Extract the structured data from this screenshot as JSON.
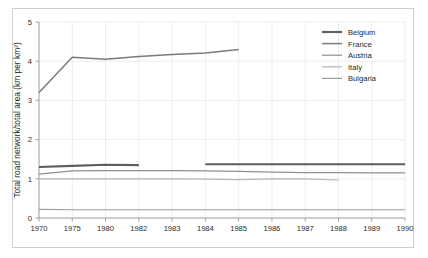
{
  "chart_data": {
    "type": "line",
    "title": "",
    "xlabel": "",
    "ylabel": "Total road network/total area (km per km²)",
    "categories": [
      "1970",
      "1975",
      "1980",
      "1982",
      "1983",
      "1984",
      "1985",
      "1986",
      "1987",
      "1988",
      "1989",
      "1990"
    ],
    "ylim": [
      0,
      5
    ],
    "yticks": [
      "0",
      "1",
      "2",
      "3",
      "4",
      "5"
    ],
    "grid": true,
    "legend_position": "top-right",
    "series": [
      {
        "name": "Belgium",
        "color": "#5e5e5e",
        "width": 2.1,
        "values": [
          1.3,
          1.33,
          1.36,
          1.35,
          null,
          1.37,
          1.37,
          1.37,
          1.37,
          1.37,
          1.37,
          1.37
        ]
      },
      {
        "name": "France",
        "color": "#7a7a7a",
        "width": 1.5,
        "values": [
          3.2,
          4.1,
          4.05,
          4.12,
          4.17,
          4.21,
          4.3,
          null,
          null,
          null,
          null,
          null
        ]
      },
      {
        "name": "Austria",
        "color": "#8f8f8f",
        "width": 1.2,
        "values": [
          1.12,
          1.2,
          1.21,
          1.21,
          1.21,
          1.2,
          1.19,
          1.17,
          1.16,
          1.16,
          1.15,
          1.15
        ]
      },
      {
        "name": "Italy",
        "color": "#b4b4b4",
        "width": 1.2,
        "values": [
          1.0,
          1.0,
          1.0,
          1.0,
          1.0,
          0.99,
          0.98,
          1.0,
          1.0,
          0.97,
          null,
          null
        ]
      },
      {
        "name": "Bulgaria",
        "color": "#9c9c9c",
        "width": 1.2,
        "values": [
          0.22,
          0.21,
          0.21,
          0.21,
          0.21,
          0.21,
          0.21,
          0.21,
          0.21,
          0.21,
          0.21,
          0.21
        ]
      }
    ]
  },
  "legend": {
    "entries": [
      {
        "label": "Belgium"
      },
      {
        "label": "France"
      },
      {
        "label": "Austria"
      },
      {
        "label": "Italy"
      },
      {
        "label": "Bulgaria"
      }
    ]
  },
  "axes": {
    "y_title": "Total road network/total area (km per km²)",
    "y_ticks": [
      "5",
      "4",
      "3",
      "2",
      "1",
      "0"
    ],
    "x_ticks": [
      "1970",
      "1975",
      "1980",
      "1982",
      "1983",
      "1984",
      "1985",
      "1986",
      "1987",
      "1988",
      "1989",
      "1990"
    ]
  },
  "colors": {
    "background": "#ffffff",
    "frame": "#cfcfcf",
    "grid": "#e8e8e8",
    "axis": "#9a9a9a",
    "text": "#1f1f1f"
  }
}
